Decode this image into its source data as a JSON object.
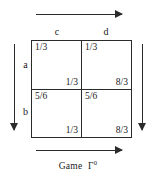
{
  "figure": {
    "caption_text": "Game",
    "caption_symbol": "Γ",
    "caption_superscript": "0",
    "ink_color": "#2b2b2b",
    "background_color": "#ffffff"
  },
  "arrows": {
    "top": {
      "name": "top-arrow",
      "direction": "right"
    },
    "bottom": {
      "name": "bottom-arrow",
      "direction": "right"
    },
    "left": {
      "name": "left-arrow",
      "direction": "down"
    },
    "right": {
      "name": "right-arrow",
      "direction": "down"
    }
  },
  "matrix": {
    "column_labels": [
      "c",
      "d"
    ],
    "row_labels": [
      "a",
      "b"
    ],
    "cells": [
      [
        {
          "top_left": "1/3",
          "bottom_right": "1/3"
        },
        {
          "top_left": "1/3",
          "bottom_right": "8/3"
        }
      ],
      [
        {
          "top_left": "5/6",
          "bottom_right": "1/3"
        },
        {
          "top_left": "5/6",
          "bottom_right": "8/3"
        }
      ]
    ]
  }
}
